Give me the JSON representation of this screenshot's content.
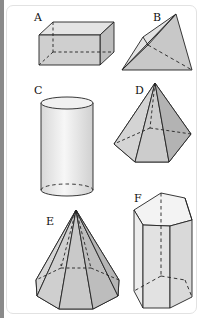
{
  "figure": {
    "shapes": [
      {
        "id": "A",
        "label": "A",
        "name": "rectangular-prism"
      },
      {
        "id": "B",
        "label": "B",
        "name": "triangular-pyramid"
      },
      {
        "id": "C",
        "label": "C",
        "name": "cylinder"
      },
      {
        "id": "D",
        "label": "D",
        "name": "pentagonal-pyramid"
      },
      {
        "id": "E",
        "label": "E",
        "name": "octagonal-pyramid"
      },
      {
        "id": "F",
        "label": "F",
        "name": "hexagonal-prism"
      }
    ],
    "colors": {
      "solid_fill": "#c9c9c9",
      "light_fill": "#e6e6e6",
      "edge": "#222222",
      "frame_strip": "#8a8a8a",
      "panel_border": "#e2e2e2"
    }
  }
}
